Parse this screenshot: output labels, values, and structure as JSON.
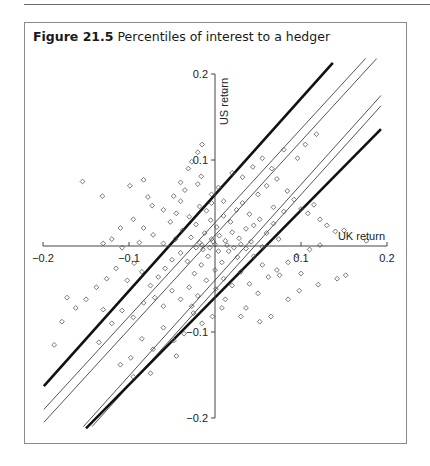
{
  "figure": {
    "label": "Figure 21.5",
    "title": "Percentiles of interest to a hedger"
  },
  "chart_data": {
    "type": "scatter",
    "title": "Percentiles of interest to a hedger",
    "xlabel": "UK return",
    "ylabel": "US return",
    "xlim": [
      -0.2,
      0.2
    ],
    "ylim": [
      -0.2,
      0.2
    ],
    "x_ticks": [
      -0.2,
      -0.1,
      0.1,
      0.2
    ],
    "x_tick_labels": [
      "-0.2",
      "-0.1",
      "0.1",
      "0.2"
    ],
    "y_ticks": [
      0.2,
      0.1,
      -0.1,
      -0.2
    ],
    "y_tick_labels": [
      "0.2",
      "0.1",
      "-0.1",
      "-0.2"
    ],
    "axes_style": "cross through origin",
    "grid": false,
    "legend": null,
    "marker": "open diamond",
    "quantile_lines": [
      {
        "name": "upper extreme percentile",
        "style": "thick",
        "x": [
          -0.199,
          0.137
        ],
        "y": [
          -0.163,
          0.213
        ]
      },
      {
        "name": "upper inner percentile 1",
        "style": "thin",
        "x": [
          -0.199,
          0.175
        ],
        "y": [
          -0.19,
          0.218
        ]
      },
      {
        "name": "upper inner percentile 2",
        "style": "thin",
        "x": [
          -0.199,
          0.188
        ],
        "y": [
          -0.205,
          0.218
        ]
      },
      {
        "name": "lower inner percentile 1",
        "style": "thin",
        "x": [
          -0.153,
          0.193
        ],
        "y": [
          -0.21,
          0.175
        ]
      },
      {
        "name": "lower inner percentile 2",
        "style": "thin",
        "x": [
          -0.143,
          0.193
        ],
        "y": [
          -0.21,
          0.163
        ]
      },
      {
        "name": "lower extreme percentile",
        "style": "thick",
        "x": [
          -0.15,
          0.193
        ],
        "y": [
          -0.212,
          0.136
        ]
      }
    ],
    "points": [
      [
        -0.154,
        0.075
      ],
      [
        -0.073,
        0.047
      ],
      [
        -0.099,
        0.07
      ],
      [
        -0.11,
        0.021
      ],
      [
        -0.016,
        0.081
      ],
      [
        -0.027,
        0.098
      ],
      [
        -0.031,
        0.09
      ],
      [
        0.011,
        0.18
      ],
      [
        -0.015,
        0.118
      ],
      [
        -0.02,
        0.109
      ],
      [
        -0.131,
        0.058
      ],
      [
        -0.078,
        0.057
      ],
      [
        -0.083,
        0.077
      ],
      [
        -0.048,
        0.058
      ],
      [
        -0.035,
        0.065
      ],
      [
        -0.04,
        0.052
      ],
      [
        -0.06,
        0.042
      ],
      [
        -0.045,
        0.038
      ],
      [
        -0.095,
        0.031
      ],
      [
        -0.083,
        0.021
      ],
      [
        -0.072,
        0.013
      ],
      [
        -0.088,
        0.004
      ],
      [
        -0.108,
        -0.002
      ],
      [
        -0.12,
        0.008
      ],
      [
        -0.052,
        0.028
      ],
      [
        -0.038,
        0.018
      ],
      [
        -0.03,
        0.034
      ],
      [
        -0.022,
        0.025
      ],
      [
        -0.01,
        0.041
      ],
      [
        -0.005,
        0.03
      ],
      [
        0.002,
        0.022
      ],
      [
        0.01,
        0.035
      ],
      [
        0.018,
        0.028
      ],
      [
        0.025,
        0.042
      ],
      [
        0.032,
        0.05
      ],
      [
        0.04,
        0.037
      ],
      [
        -0.028,
        0.01
      ],
      [
        -0.018,
        0.004
      ],
      [
        -0.012,
        0.015
      ],
      [
        -0.004,
        0.008
      ],
      [
        0.005,
        0.012
      ],
      [
        0.012,
        0.006
      ],
      [
        0.02,
        0.016
      ],
      [
        0.028,
        0.009
      ],
      [
        0.036,
        0.02
      ],
      [
        0.045,
        0.024
      ],
      [
        0.052,
        0.031
      ],
      [
        0.06,
        0.015
      ],
      [
        0.068,
        0.026
      ],
      [
        0.074,
        0.008
      ],
      [
        0.05,
        0.06
      ],
      [
        0.06,
        0.07
      ],
      [
        0.072,
        0.078
      ],
      [
        0.084,
        0.064
      ],
      [
        0.092,
        0.054
      ],
      [
        0.1,
        0.043
      ],
      [
        0.108,
        0.038
      ],
      [
        0.115,
        0.048
      ],
      [
        0.122,
        0.031
      ],
      [
        0.13,
        0.024
      ],
      [
        0.14,
        0.017
      ],
      [
        0.15,
        0.018
      ],
      [
        0.176,
        0.006
      ],
      [
        0.122,
        0.001
      ],
      [
        0.11,
        -0.004
      ],
      [
        0.095,
        -0.011
      ],
      [
        0.085,
        -0.019
      ],
      [
        0.072,
        -0.028
      ],
      [
        0.062,
        -0.036
      ],
      [
        0.055,
        -0.022
      ],
      [
        0.045,
        -0.012
      ],
      [
        0.036,
        -0.003
      ],
      [
        0.026,
        -0.013
      ],
      [
        0.016,
        -0.006
      ],
      [
        0.008,
        -0.019
      ],
      [
        0.0,
        -0.028
      ],
      [
        -0.008,
        -0.012
      ],
      [
        -0.016,
        -0.022
      ],
      [
        -0.024,
        -0.032
      ],
      [
        -0.032,
        -0.018
      ],
      [
        -0.04,
        -0.008
      ],
      [
        -0.05,
        -0.016
      ],
      [
        -0.058,
        -0.026
      ],
      [
        -0.066,
        -0.036
      ],
      [
        -0.075,
        -0.046
      ],
      [
        -0.085,
        -0.03
      ],
      [
        -0.094,
        -0.02
      ],
      [
        -0.102,
        -0.04
      ],
      [
        -0.115,
        -0.026
      ],
      [
        -0.126,
        -0.038
      ],
      [
        -0.138,
        -0.048
      ],
      [
        -0.15,
        -0.062
      ],
      [
        -0.162,
        -0.072
      ],
      [
        -0.172,
        -0.06
      ],
      [
        -0.178,
        -0.088
      ],
      [
        -0.187,
        -0.115
      ],
      [
        -0.13,
        -0.074
      ],
      [
        -0.12,
        -0.09
      ],
      [
        -0.108,
        -0.075
      ],
      [
        -0.095,
        -0.083
      ],
      [
        -0.083,
        -0.066
      ],
      [
        -0.07,
        -0.06
      ],
      [
        -0.06,
        -0.07
      ],
      [
        -0.05,
        -0.052
      ],
      [
        -0.04,
        -0.062
      ],
      [
        -0.03,
        -0.048
      ],
      [
        -0.02,
        -0.058
      ],
      [
        -0.01,
        -0.04
      ],
      [
        0.001,
        -0.05
      ],
      [
        0.01,
        -0.038
      ],
      [
        0.02,
        -0.046
      ],
      [
        0.03,
        -0.03
      ],
      [
        0.04,
        -0.044
      ],
      [
        0.05,
        -0.055
      ],
      [
        0.008,
        -0.072
      ],
      [
        -0.003,
        -0.082
      ],
      [
        -0.015,
        -0.09
      ],
      [
        -0.025,
        -0.078
      ],
      [
        -0.036,
        -0.102
      ],
      [
        -0.048,
        -0.11
      ],
      [
        -0.06,
        -0.095
      ],
      [
        -0.072,
        -0.12
      ],
      [
        -0.085,
        -0.108
      ],
      [
        -0.098,
        -0.13
      ],
      [
        -0.11,
        -0.138
      ],
      [
        -0.135,
        -0.112
      ],
      [
        -0.095,
        -0.152
      ],
      [
        -0.075,
        -0.148
      ],
      [
        -0.045,
        -0.128
      ],
      [
        -0.027,
        -0.07
      ],
      [
        0.012,
        -0.062
      ],
      [
        0.03,
        -0.082
      ],
      [
        0.036,
        -0.072
      ],
      [
        0.052,
        -0.088
      ],
      [
        0.065,
        -0.082
      ],
      [
        0.085,
        -0.062
      ],
      [
        0.098,
        -0.052
      ],
      [
        0.075,
        -0.034
      ],
      [
        0.1,
        -0.032
      ],
      [
        0.12,
        -0.045
      ],
      [
        0.142,
        -0.038
      ],
      [
        0.152,
        -0.034
      ],
      [
        -0.004,
        0.06
      ],
      [
        0.004,
        0.068
      ],
      [
        -0.02,
        0.072
      ],
      [
        -0.04,
        0.074
      ],
      [
        0.02,
        0.085
      ],
      [
        0.032,
        0.08
      ],
      [
        0.044,
        0.092
      ],
      [
        0.055,
        0.102
      ],
      [
        0.066,
        0.09
      ],
      [
        0.08,
        0.112
      ],
      [
        0.096,
        0.102
      ],
      [
        0.105,
        0.118
      ],
      [
        0.118,
        0.13
      ],
      [
        0.022,
        -0.002
      ],
      [
        -0.006,
        -0.002
      ],
      [
        -0.014,
        -0.004
      ],
      [
        0.0,
        0.002
      ],
      [
        0.004,
        -0.006
      ],
      [
        -0.002,
        0.005
      ],
      [
        0.014,
        0.001
      ],
      [
        -0.022,
        -0.002
      ],
      [
        0.03,
        0.002
      ],
      [
        -0.046,
        0.008
      ],
      [
        0.042,
        0.005
      ],
      [
        -0.06,
        0.003
      ],
      [
        0.055,
        -0.001
      ],
      [
        -0.004,
        0.05
      ],
      [
        0.01,
        0.052
      ],
      [
        -0.018,
        0.046
      ],
      [
        0.068,
        0.045
      ],
      [
        0.08,
        0.04
      ],
      [
        -0.015,
        0.001
      ],
      [
        -0.13,
        0.003
      ]
    ]
  },
  "plot_mapping": {
    "x_origin_px": 215,
    "y_origin_px": 246,
    "px_per_unit": 860
  }
}
